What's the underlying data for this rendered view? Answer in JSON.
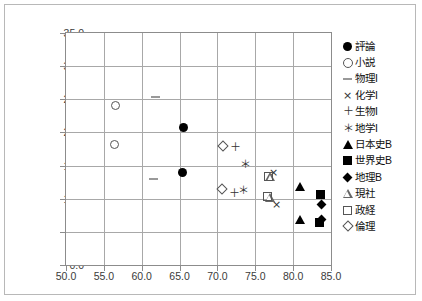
{
  "chart_data": {
    "type": "scatter",
    "title": "",
    "xlabel": "",
    "ylabel": "",
    "xlim": [
      50.0,
      85.0
    ],
    "ylim": [
      0.0,
      35.0
    ],
    "xticks": [
      "50.0",
      "55.0",
      "60.0",
      "65.0",
      "70.0",
      "75.0",
      "80.0",
      "85.0"
    ],
    "yticks": [
      "0.0",
      "5.0",
      "10.0",
      "15.0",
      "20.0",
      "25.0",
      "30.0",
      "35.0"
    ],
    "grid": true,
    "legend_position": "right",
    "series": [
      {
        "name": "評論",
        "marker": "filled-circle",
        "points": [
          {
            "x": 65.5,
            "y": 20.8
          },
          {
            "x": 65.4,
            "y": 14.0
          }
        ]
      },
      {
        "name": "小説",
        "marker": "open-circle",
        "points": [
          {
            "x": 56.5,
            "y": 24.0
          },
          {
            "x": 56.4,
            "y": 18.2
          }
        ]
      },
      {
        "name": "物理I",
        "marker": "dash",
        "points": [
          {
            "x": 61.8,
            "y": 25.4
          },
          {
            "x": 61.6,
            "y": 12.9
          }
        ]
      },
      {
        "name": "化学I",
        "marker": "cross",
        "points": [
          {
            "x": 77.4,
            "y": 13.9
          },
          {
            "x": 77.8,
            "y": 9.2
          }
        ]
      },
      {
        "name": "生物I",
        "marker": "plus",
        "points": [
          {
            "x": 72.2,
            "y": 17.7
          },
          {
            "x": 72.1,
            "y": 10.8
          }
        ]
      },
      {
        "name": "地学I",
        "marker": "star",
        "points": [
          {
            "x": 73.6,
            "y": 15.2
          },
          {
            "x": 73.3,
            "y": 11.3
          }
        ]
      },
      {
        "name": "日本史B",
        "marker": "filled-triangle",
        "points": [
          {
            "x": 80.9,
            "y": 11.9
          },
          {
            "x": 80.9,
            "y": 6.9
          }
        ]
      },
      {
        "name": "世界史B",
        "marker": "filled-square",
        "points": [
          {
            "x": 83.6,
            "y": 10.7
          },
          {
            "x": 83.5,
            "y": 6.4
          }
        ]
      },
      {
        "name": "地理B",
        "marker": "filled-diamond",
        "points": [
          {
            "x": 83.7,
            "y": 9.2
          },
          {
            "x": 83.8,
            "y": 6.8
          }
        ]
      },
      {
        "name": "現社",
        "marker": "open-triangle",
        "points": [
          {
            "x": 77.0,
            "y": 13.3
          },
          {
            "x": 76.9,
            "y": 10.2
          }
        ]
      },
      {
        "name": "政経",
        "marker": "open-square",
        "points": [
          {
            "x": 76.7,
            "y": 13.4
          },
          {
            "x": 76.6,
            "y": 10.4
          }
        ]
      },
      {
        "name": "倫理",
        "marker": "open-diamond",
        "points": [
          {
            "x": 70.7,
            "y": 17.9
          },
          {
            "x": 70.6,
            "y": 11.4
          }
        ]
      }
    ]
  },
  "legend": {
    "items": [
      {
        "label": "評論",
        "marker": "filled-circle"
      },
      {
        "label": "小説",
        "marker": "open-circle"
      },
      {
        "label": "物理I",
        "marker": "dash"
      },
      {
        "label": "化学I",
        "marker": "cross"
      },
      {
        "label": "生物I",
        "marker": "plus"
      },
      {
        "label": "地学I",
        "marker": "star"
      },
      {
        "label": "日本史B",
        "marker": "filled-triangle"
      },
      {
        "label": "世界史B",
        "marker": "filled-square"
      },
      {
        "label": "地理B",
        "marker": "filled-diamond"
      },
      {
        "label": "現社",
        "marker": "open-triangle"
      },
      {
        "label": "政経",
        "marker": "open-square"
      },
      {
        "label": "倫理",
        "marker": "open-diamond"
      }
    ]
  },
  "glyphs": {
    "plus": "＋",
    "cross": "×",
    "star": "＊"
  }
}
